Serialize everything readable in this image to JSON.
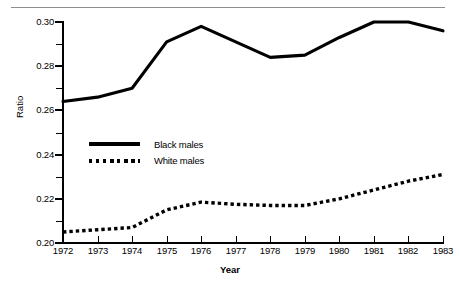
{
  "figure": {
    "has_top_rule": true,
    "background_color": "#ffffff",
    "ink_color": "#000000"
  },
  "axes": {
    "y_title": "Ratio",
    "x_title": "Year"
  },
  "legend": {
    "entries": [
      {
        "label": "Black males",
        "style": "solid",
        "color": "#000000"
      },
      {
        "label": "White males",
        "style": "dotted",
        "color": "#000000"
      }
    ]
  },
  "chart_data": {
    "type": "line",
    "title": "",
    "xlabel": "Year",
    "ylabel": "Ratio",
    "x": [
      1972,
      1973,
      1974,
      1975,
      1976,
      1977,
      1978,
      1979,
      1980,
      1981,
      1982,
      1983
    ],
    "xtick_labels": [
      "1972",
      "1973",
      "1974",
      "1975",
      "1976",
      "1977",
      "1978",
      "1979",
      "1980",
      "1981",
      "1982",
      "1983"
    ],
    "ytick_labels": [
      "0.20",
      "0.22",
      "0.24",
      "0.26",
      "0.28",
      "0.30"
    ],
    "yticks": [
      0.2,
      0.22,
      0.24,
      0.26,
      0.28,
      0.3
    ],
    "yticks_minor": [
      0.21,
      0.23,
      0.25,
      0.27,
      0.29
    ],
    "ylim": [
      0.2,
      0.3
    ],
    "xlim": [
      1972,
      1983
    ],
    "grid": false,
    "legend_position": "center-left",
    "series": [
      {
        "name": "Black males",
        "style": "solid",
        "color": "#000000",
        "values": [
          0.264,
          0.266,
          0.27,
          0.291,
          0.298,
          0.291,
          0.284,
          0.285,
          0.293,
          0.3,
          0.3,
          0.296
        ]
      },
      {
        "name": "White males",
        "style": "dotted",
        "color": "#000000",
        "values": [
          0.205,
          0.206,
          0.207,
          0.215,
          0.2185,
          0.2175,
          0.217,
          0.217,
          0.22,
          0.224,
          0.228,
          0.231
        ]
      }
    ]
  }
}
